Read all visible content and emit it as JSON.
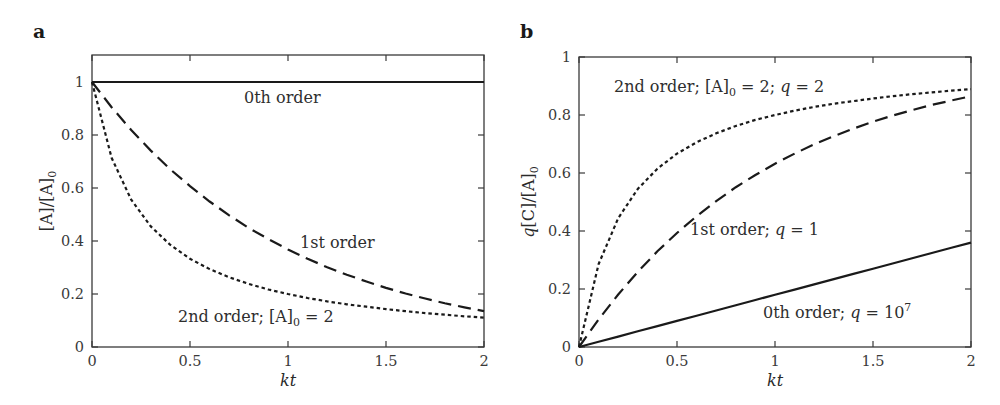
{
  "figure": {
    "panels": [
      {
        "letter": "a",
        "xlabel": "kt",
        "ylabel": "[A]/[A]0",
        "annotations": [
          {
            "text": "0th order"
          },
          {
            "text": "1st order"
          },
          {
            "text": "2nd order; [A]0 = 2"
          }
        ]
      },
      {
        "letter": "b",
        "xlabel": "kt",
        "ylabel": "q[C]/[A]0",
        "annotations": [
          {
            "text": "2nd order; [A]0 = 2; q = 2"
          },
          {
            "text": "1st order; q = 1"
          },
          {
            "text": "0th order; q = 10^7"
          }
        ]
      }
    ]
  },
  "chart_data": [
    {
      "type": "line",
      "panel": "a",
      "title": "",
      "xlabel": "kt",
      "ylabel": "[A]/[A]0",
      "xlim": [
        0,
        2
      ],
      "ylim": [
        0,
        1.1
      ],
      "xticks": [
        0,
        0.5,
        1,
        1.5,
        2
      ],
      "xtick_labels": [
        "0",
        "0.5",
        "1",
        "1.5",
        "2"
      ],
      "yticks": [
        0,
        0.2,
        0.4,
        0.6,
        0.8,
        1
      ],
      "ytick_labels": [
        "0",
        "0.2",
        "0.4",
        "0.6",
        "0.8",
        "1"
      ],
      "grid": false,
      "legend": "inline annotations",
      "x": [
        0,
        0.1,
        0.2,
        0.3,
        0.4,
        0.5,
        0.6,
        0.7,
        0.8,
        0.9,
        1.0,
        1.1,
        1.2,
        1.3,
        1.4,
        1.5,
        1.6,
        1.7,
        1.8,
        1.9,
        2.0
      ],
      "series": [
        {
          "name": "0th order",
          "style": "solid",
          "values": [
            1,
            1,
            1,
            1,
            1,
            1,
            1,
            1,
            1,
            1,
            1,
            1,
            1,
            1,
            1,
            1,
            1,
            1,
            1,
            1,
            1
          ]
        },
        {
          "name": "1st order",
          "style": "dashed",
          "values": [
            1.0,
            0.905,
            0.819,
            0.741,
            0.67,
            0.607,
            0.549,
            0.497,
            0.449,
            0.407,
            0.368,
            0.333,
            0.301,
            0.273,
            0.247,
            0.223,
            0.202,
            0.183,
            0.165,
            0.15,
            0.135
          ]
        },
        {
          "name": "2nd order; [A]0 = 2",
          "style": "dotted",
          "values": [
            1.0,
            0.714,
            0.556,
            0.455,
            0.385,
            0.333,
            0.294,
            0.263,
            0.238,
            0.217,
            0.2,
            0.185,
            0.172,
            0.161,
            0.152,
            0.143,
            0.135,
            0.128,
            0.122,
            0.116,
            0.111
          ]
        }
      ]
    },
    {
      "type": "line",
      "panel": "b",
      "title": "",
      "xlabel": "kt",
      "ylabel": "q[C]/[A]0",
      "xlim": [
        0,
        2
      ],
      "ylim": [
        0,
        1
      ],
      "xticks": [
        0,
        0.5,
        1,
        1.5,
        2
      ],
      "xtick_labels": [
        "0",
        "0.5",
        "1",
        "1.5",
        "2"
      ],
      "yticks": [
        0,
        0.2,
        0.4,
        0.6,
        0.8,
        1
      ],
      "ytick_labels": [
        "0",
        "0.2",
        "0.4",
        "0.6",
        "0.8",
        "1"
      ],
      "grid": false,
      "legend": "inline annotations",
      "x": [
        0,
        0.1,
        0.2,
        0.3,
        0.4,
        0.5,
        0.6,
        0.7,
        0.8,
        0.9,
        1.0,
        1.1,
        1.2,
        1.3,
        1.4,
        1.5,
        1.6,
        1.7,
        1.8,
        1.9,
        2.0
      ],
      "series": [
        {
          "name": "2nd order; [A]0 = 2; q = 2",
          "style": "dotted",
          "values": [
            0.0,
            0.286,
            0.444,
            0.545,
            0.615,
            0.667,
            0.706,
            0.737,
            0.762,
            0.783,
            0.8,
            0.815,
            0.828,
            0.839,
            0.848,
            0.857,
            0.865,
            0.872,
            0.878,
            0.884,
            0.889
          ]
        },
        {
          "name": "1st order; q = 1",
          "style": "dashed",
          "values": [
            0.0,
            0.095,
            0.181,
            0.259,
            0.33,
            0.393,
            0.451,
            0.503,
            0.551,
            0.593,
            0.632,
            0.667,
            0.699,
            0.727,
            0.753,
            0.777,
            0.798,
            0.817,
            0.835,
            0.85,
            0.865
          ]
        },
        {
          "name": "0th order; q = 10^7",
          "style": "solid",
          "values": [
            0.0,
            0.018,
            0.036,
            0.054,
            0.072,
            0.09,
            0.108,
            0.126,
            0.144,
            0.162,
            0.18,
            0.198,
            0.216,
            0.234,
            0.252,
            0.27,
            0.288,
            0.306,
            0.324,
            0.342,
            0.36
          ]
        }
      ]
    }
  ]
}
